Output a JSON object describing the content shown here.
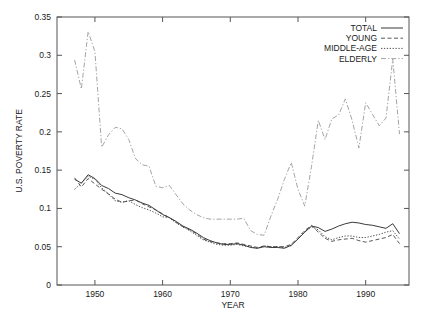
{
  "chart_data": {
    "type": "line",
    "title": "",
    "xlabel": "YEAR",
    "ylabel": "U.S. POVERTY RATE",
    "xlim": [
      1944.4,
      1996.4
    ],
    "ylim": [
      0,
      0.35
    ],
    "xticks": [
      "1950",
      "1960",
      "1970",
      "1980",
      "1990"
    ],
    "xtick_values": [
      1950,
      1960,
      1970,
      1980,
      1990
    ],
    "yticks": [
      "0",
      "0.05",
      "0.1",
      "0.15",
      "0.2",
      "0.25",
      "0.3",
      "0.35"
    ],
    "ytick_values": [
      0,
      0.05,
      0.1,
      0.15,
      0.2,
      0.25,
      0.3,
      0.35
    ],
    "grid": false,
    "legend_position": "top-right",
    "x": [
      1947,
      1948,
      1949,
      1950,
      1951,
      1952,
      1953,
      1954,
      1955,
      1956,
      1957,
      1958,
      1959,
      1960,
      1961,
      1962,
      1963,
      1964,
      1965,
      1966,
      1967,
      1968,
      1969,
      1970,
      1971,
      1972,
      1973,
      1974,
      1975,
      1976,
      1977,
      1978,
      1979,
      1980,
      1981,
      1982,
      1983,
      1984,
      1985,
      1986,
      1987,
      1988,
      1989,
      1990,
      1991,
      1992,
      1993,
      1994,
      1995
    ],
    "series": [
      {
        "name": "TOTAL",
        "style": "solid",
        "color": "#222222",
        "values": [
          0.138,
          0.133,
          0.144,
          0.139,
          0.13,
          0.126,
          0.12,
          0.118,
          0.114,
          0.111,
          0.107,
          0.104,
          0.098,
          0.092,
          0.088,
          0.083,
          0.077,
          0.073,
          0.068,
          0.062,
          0.058,
          0.055,
          0.053,
          0.053,
          0.054,
          0.052,
          0.049,
          0.048,
          0.05,
          0.049,
          0.049,
          0.048,
          0.052,
          0.06,
          0.069,
          0.077,
          0.075,
          0.07,
          0.073,
          0.077,
          0.08,
          0.082,
          0.081,
          0.079,
          0.078,
          0.076,
          0.074,
          0.08,
          0.067
        ]
      },
      {
        "name": "YOUNG",
        "style": "dashed",
        "color": "#444444",
        "values": [
          0.14,
          0.128,
          0.139,
          0.132,
          0.125,
          0.119,
          0.112,
          0.108,
          0.11,
          0.111,
          0.106,
          0.102,
          0.098,
          0.093,
          0.088,
          0.082,
          0.076,
          0.072,
          0.067,
          0.06,
          0.057,
          0.055,
          0.054,
          0.054,
          0.055,
          0.053,
          0.051,
          0.049,
          0.051,
          0.05,
          0.05,
          0.05,
          0.053,
          0.062,
          0.071,
          0.078,
          0.069,
          0.061,
          0.057,
          0.059,
          0.06,
          0.061,
          0.058,
          0.056,
          0.058,
          0.06,
          0.062,
          0.066,
          0.054
        ]
      },
      {
        "name": "MIDDLE-AGE",
        "style": "dotted",
        "color": "#3a3a3a",
        "values": [
          0.125,
          0.133,
          0.142,
          0.138,
          0.127,
          0.119,
          0.11,
          0.108,
          0.11,
          0.105,
          0.101,
          0.098,
          0.094,
          0.089,
          0.088,
          0.081,
          0.076,
          0.071,
          0.065,
          0.059,
          0.056,
          0.053,
          0.052,
          0.052,
          0.053,
          0.051,
          0.05,
          0.048,
          0.051,
          0.05,
          0.05,
          0.049,
          0.051,
          0.06,
          0.07,
          0.076,
          0.072,
          0.063,
          0.059,
          0.062,
          0.064,
          0.064,
          0.062,
          0.062,
          0.064,
          0.066,
          0.069,
          0.071,
          0.06
        ]
      },
      {
        "name": "ELDERLY",
        "style": "longdash",
        "color": "#9a9a9a",
        "values": [
          0.294,
          0.256,
          0.331,
          0.305,
          0.18,
          0.196,
          0.206,
          0.204,
          0.19,
          0.165,
          0.157,
          0.155,
          0.129,
          0.127,
          0.13,
          0.118,
          0.106,
          0.098,
          0.092,
          0.088,
          0.086,
          0.086,
          0.086,
          0.086,
          0.086,
          0.087,
          0.071,
          0.066,
          0.065,
          0.062,
          0.061,
          0.06,
          0.063,
          0.088,
          0.075,
          0.065,
          0.062,
          0.066,
          0.067,
          0.066,
          0.063,
          0.061,
          0.058,
          0.049,
          0.051,
          0.045,
          0.044,
          0.042,
          0.037
        ]
      }
    ],
    "elderly_late_values": [
      0.09,
      0.112,
      0.138,
      0.16,
      0.125,
      0.103,
      0.155,
      0.215,
      0.19,
      0.217,
      0.222,
      0.243,
      0.215,
      0.179,
      0.238,
      0.223,
      0.208,
      0.218,
      0.295,
      0.197
    ]
  },
  "legend": {
    "entries": [
      {
        "label": "TOTAL"
      },
      {
        "label": "YOUNG"
      },
      {
        "label": "MIDDLE-AGE"
      },
      {
        "label": "ELDERLY"
      }
    ]
  }
}
